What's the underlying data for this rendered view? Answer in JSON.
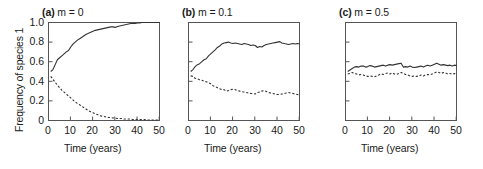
{
  "figure": {
    "ylabel": "Frequency of species 1",
    "xlabel": "Time (years)",
    "ytick_labels": [
      "1.0",
      "0.8",
      "0.6",
      "0.4",
      "0.2",
      "0"
    ],
    "xtick_labels": [
      "0",
      "10",
      "20",
      "30",
      "40",
      "50"
    ],
    "line_color": "#333333",
    "axis_color": "#555555"
  },
  "chart_data": [
    {
      "type": "line",
      "title": "(a) m = 0",
      "title_tag": "(a)",
      "title_rest": " m = 0",
      "xlabel": "Time (years)",
      "ylabel": "Frequency of species 1",
      "xlim": [
        0,
        50
      ],
      "ylim": [
        0,
        1.0
      ],
      "xticks": [
        0,
        10,
        20,
        30,
        40,
        50
      ],
      "yticks": [
        0,
        0.2,
        0.4,
        0.6,
        0.8,
        1.0
      ],
      "grid": false,
      "legend": "none",
      "x": [
        1,
        2,
        3,
        4,
        5,
        6,
        7,
        8,
        9,
        10,
        11,
        12,
        13,
        14,
        15,
        16,
        17,
        18,
        19,
        20,
        21,
        22,
        23,
        24,
        25,
        26,
        27,
        28,
        29,
        30,
        31,
        32,
        33,
        34,
        35,
        36,
        37,
        38,
        39,
        40,
        41,
        42,
        43,
        44,
        45,
        46,
        47,
        48,
        49,
        50
      ],
      "series": [
        {
          "name": "species 1 (solid)",
          "style": "solid",
          "values": [
            0.5,
            0.52,
            0.57,
            0.62,
            0.64,
            0.66,
            0.68,
            0.7,
            0.715,
            0.75,
            0.78,
            0.8,
            0.82,
            0.835,
            0.85,
            0.865,
            0.88,
            0.89,
            0.9,
            0.91,
            0.92,
            0.925,
            0.93,
            0.935,
            0.94,
            0.945,
            0.95,
            0.955,
            0.955,
            0.95,
            0.96,
            0.965,
            0.97,
            0.975,
            0.98,
            0.985,
            0.99,
            0.99,
            0.99,
            0.995,
            0.995,
            1.0,
            1.0,
            1.0,
            1.0,
            1.0,
            1.0,
            1.0,
            1.0,
            1.0
          ]
        },
        {
          "name": "species 2 (dashed)",
          "style": "dashed",
          "values": [
            0.45,
            0.42,
            0.39,
            0.36,
            0.335,
            0.31,
            0.29,
            0.27,
            0.25,
            0.23,
            0.21,
            0.19,
            0.175,
            0.16,
            0.145,
            0.13,
            0.115,
            0.1,
            0.09,
            0.08,
            0.07,
            0.06,
            0.05,
            0.045,
            0.04,
            0.035,
            0.03,
            0.03,
            0.025,
            0.025,
            0.02,
            0.02,
            0.02,
            0.015,
            0.015,
            0.015,
            0.015,
            0.01,
            0.01,
            0.01,
            0.01,
            0.01,
            0.01,
            0.005,
            0.005,
            0.005,
            0.005,
            0.005,
            0.005,
            0.005
          ]
        }
      ]
    },
    {
      "type": "line",
      "title": "(b) m = 0.1",
      "title_tag": "(b)",
      "title_rest": " m = 0.1",
      "xlabel": "Time (years)",
      "ylabel": "",
      "xlim": [
        0,
        50
      ],
      "ylim": [
        0,
        1.0
      ],
      "xticks": [
        0,
        10,
        20,
        30,
        40,
        50
      ],
      "yticks": [
        0,
        0.2,
        0.4,
        0.6,
        0.8,
        1.0
      ],
      "grid": false,
      "legend": "none",
      "x": [
        1,
        2,
        3,
        4,
        5,
        6,
        7,
        8,
        9,
        10,
        11,
        12,
        13,
        14,
        15,
        16,
        17,
        18,
        19,
        20,
        21,
        22,
        23,
        24,
        25,
        26,
        27,
        28,
        29,
        30,
        31,
        32,
        33,
        34,
        35,
        36,
        37,
        38,
        39,
        40,
        41,
        42,
        43,
        44,
        45,
        46,
        47,
        48,
        49,
        50
      ],
      "series": [
        {
          "name": "species 1 (solid)",
          "style": "solid",
          "values": [
            0.5,
            0.52,
            0.55,
            0.57,
            0.58,
            0.6,
            0.62,
            0.63,
            0.66,
            0.68,
            0.7,
            0.72,
            0.745,
            0.76,
            0.78,
            0.79,
            0.795,
            0.8,
            0.79,
            0.785,
            0.79,
            0.785,
            0.78,
            0.775,
            0.785,
            0.78,
            0.775,
            0.765,
            0.77,
            0.765,
            0.745,
            0.755,
            0.75,
            0.765,
            0.775,
            0.78,
            0.785,
            0.79,
            0.795,
            0.8,
            0.805,
            0.79,
            0.785,
            0.78,
            0.775,
            0.78,
            0.785,
            0.78,
            0.785,
            0.78
          ]
        },
        {
          "name": "species 2 (dashed)",
          "style": "dashed",
          "values": [
            0.455,
            0.45,
            0.43,
            0.425,
            0.415,
            0.41,
            0.4,
            0.395,
            0.385,
            0.375,
            0.355,
            0.345,
            0.335,
            0.325,
            0.315,
            0.315,
            0.3,
            0.305,
            0.315,
            0.32,
            0.315,
            0.305,
            0.3,
            0.295,
            0.29,
            0.285,
            0.28,
            0.275,
            0.275,
            0.27,
            0.285,
            0.29,
            0.3,
            0.305,
            0.295,
            0.285,
            0.28,
            0.275,
            0.27,
            0.265,
            0.265,
            0.27,
            0.275,
            0.28,
            0.285,
            0.28,
            0.275,
            0.27,
            0.265,
            0.26
          ]
        }
      ]
    },
    {
      "type": "line",
      "title": "(c) m = 0.5",
      "title_tag": "(c)",
      "title_rest": " m = 0.5",
      "xlabel": "Time (years)",
      "ylabel": "",
      "xlim": [
        0,
        50
      ],
      "ylim": [
        0,
        1.0
      ],
      "xticks": [
        0,
        10,
        20,
        30,
        40,
        50
      ],
      "yticks": [
        0,
        0.2,
        0.4,
        0.6,
        0.8,
        1.0
      ],
      "grid": false,
      "legend": "none",
      "x": [
        1,
        2,
        3,
        4,
        5,
        6,
        7,
        8,
        9,
        10,
        11,
        12,
        13,
        14,
        15,
        16,
        17,
        18,
        19,
        20,
        21,
        22,
        23,
        24,
        25,
        26,
        27,
        28,
        29,
        30,
        31,
        32,
        33,
        34,
        35,
        36,
        37,
        38,
        39,
        40,
        41,
        42,
        43,
        44,
        45,
        46,
        47,
        48,
        49,
        50
      ],
      "series": [
        {
          "name": "species 1 (solid)",
          "style": "solid",
          "values": [
            0.5,
            0.515,
            0.53,
            0.545,
            0.55,
            0.545,
            0.555,
            0.555,
            0.545,
            0.55,
            0.56,
            0.555,
            0.545,
            0.55,
            0.555,
            0.56,
            0.565,
            0.555,
            0.565,
            0.57,
            0.565,
            0.57,
            0.575,
            0.58,
            0.585,
            0.545,
            0.55,
            0.545,
            0.555,
            0.545,
            0.54,
            0.545,
            0.55,
            0.555,
            0.545,
            0.555,
            0.565,
            0.555,
            0.565,
            0.575,
            0.585,
            0.575,
            0.565,
            0.57,
            0.565,
            0.56,
            0.565,
            0.555,
            0.565,
            0.56
          ]
        },
        {
          "name": "species 2 (dashed)",
          "style": "dashed",
          "values": [
            0.475,
            0.48,
            0.49,
            0.48,
            0.475,
            0.465,
            0.47,
            0.465,
            0.455,
            0.45,
            0.455,
            0.45,
            0.445,
            0.455,
            0.465,
            0.475,
            0.47,
            0.48,
            0.485,
            0.475,
            0.485,
            0.475,
            0.47,
            0.48,
            0.49,
            0.48,
            0.47,
            0.465,
            0.455,
            0.45,
            0.455,
            0.45,
            0.455,
            0.465,
            0.455,
            0.465,
            0.47,
            0.465,
            0.475,
            0.485,
            0.495,
            0.49,
            0.48,
            0.49,
            0.485,
            0.475,
            0.48,
            0.47,
            0.48,
            0.475
          ]
        }
      ]
    }
  ]
}
